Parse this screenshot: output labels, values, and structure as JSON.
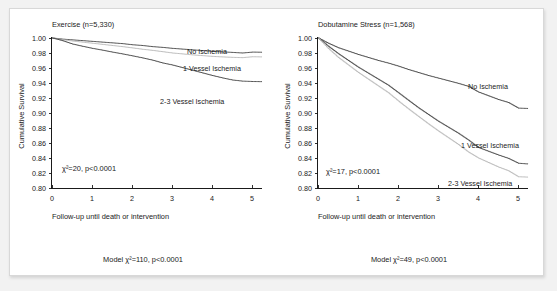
{
  "figure": {
    "background_color": "#f2f2f2",
    "panel_color": "#ffffff",
    "border_color": "#d8d8d8"
  },
  "chart_data": [
    {
      "type": "line",
      "id": "exercise",
      "title": "Exercise (n=5,330)",
      "xlabel": "Follow-up until death or intervention",
      "ylabel": "Cumulative Survival",
      "xlim": [
        0,
        5.25
      ],
      "ylim": [
        0.8,
        1.0
      ],
      "xticks": [
        "0",
        "1",
        "2",
        "3",
        "4",
        "5"
      ],
      "xtick_values": [
        0,
        1,
        2,
        3,
        4,
        5
      ],
      "yticks": [
        "1.00",
        "0.98",
        "0.96",
        "0.94",
        "0.92",
        "0.90",
        "0.88",
        "0.86",
        "0.84",
        "0.82",
        "0.80"
      ],
      "ytick_values": [
        1.0,
        0.98,
        0.96,
        0.94,
        0.92,
        0.9,
        0.88,
        0.86,
        0.84,
        0.82,
        0.8
      ],
      "grid": false,
      "legend_position": "inline-right-of-curves",
      "annotation": "χ²=20, p<0.0001",
      "footer": "Model χ²=110, p<0.0001",
      "series": [
        {
          "name": "No Ischemia",
          "color": "#3a3a3a",
          "label_position": "upper-right",
          "x": [
            0,
            0.25,
            0.5,
            0.75,
            1.0,
            1.25,
            1.5,
            1.75,
            2.0,
            2.25,
            2.5,
            2.75,
            3.0,
            3.25,
            3.5,
            3.75,
            4.0,
            4.25,
            4.5,
            4.75,
            5.0,
            5.25
          ],
          "values": [
            1.0,
            0.9985,
            0.9975,
            0.9965,
            0.9955,
            0.9945,
            0.9935,
            0.9925,
            0.991,
            0.99,
            0.9885,
            0.9875,
            0.9862,
            0.9852,
            0.9842,
            0.9832,
            0.9822,
            0.9815,
            0.9808,
            0.98,
            0.9812,
            0.981
          ]
        },
        {
          "name": "1 Vessel Ischemia",
          "color": "#b4b4b4",
          "label_position": "middle-right",
          "x": [
            0,
            0.25,
            0.5,
            0.75,
            1.0,
            1.25,
            1.5,
            1.75,
            2.0,
            2.25,
            2.5,
            2.75,
            3.0,
            3.25,
            3.5,
            3.75,
            4.0,
            4.25,
            4.5,
            4.75,
            5.0,
            5.25
          ],
          "values": [
            1.0,
            0.9978,
            0.996,
            0.9945,
            0.993,
            0.9915,
            0.99,
            0.9885,
            0.9868,
            0.985,
            0.9835,
            0.9818,
            0.98,
            0.9788,
            0.9775,
            0.9765,
            0.9755,
            0.9748,
            0.9742,
            0.9738,
            0.975,
            0.9748
          ]
        },
        {
          "name": "2-3 Vessel Ischemia",
          "color": "#3a3a3a",
          "label_position": "lower-right",
          "x": [
            0,
            0.25,
            0.5,
            0.75,
            1.0,
            1.25,
            1.5,
            1.75,
            2.0,
            2.25,
            2.5,
            2.75,
            3.0,
            3.25,
            3.5,
            3.75,
            4.0,
            4.25,
            4.5,
            4.75,
            5.0,
            5.25
          ],
          "values": [
            1.0,
            0.9965,
            0.992,
            0.989,
            0.9862,
            0.9838,
            0.9812,
            0.9788,
            0.9762,
            0.9735,
            0.9705,
            0.9668,
            0.964,
            0.9605,
            0.957,
            0.9535,
            0.95,
            0.9468,
            0.944,
            0.9425,
            0.942,
            0.9418
          ]
        }
      ]
    },
    {
      "type": "line",
      "id": "dobutamine",
      "title": "Dobutamine Stress (n=1,568)",
      "xlabel": "Follow-up until death or intervention",
      "ylabel": "Cumulative Survival",
      "xlim": [
        0,
        5.25
      ],
      "ylim": [
        0.8,
        1.0
      ],
      "xticks": [
        "0",
        "1",
        "2",
        "3",
        "4",
        "5"
      ],
      "xtick_values": [
        0,
        1,
        2,
        3,
        4,
        5
      ],
      "yticks": [
        "1.00",
        "0.98",
        "0.96",
        "0.94",
        "0.92",
        "0.90",
        "0.88",
        "0.86",
        "0.84",
        "0.82",
        "0.80"
      ],
      "ytick_values": [
        1.0,
        0.98,
        0.96,
        0.94,
        0.92,
        0.9,
        0.88,
        0.86,
        0.84,
        0.82,
        0.8
      ],
      "grid": false,
      "legend_position": "inline-right-of-curves",
      "annotation": "χ²=17, p<0.0001",
      "footer": "Model χ²=49, p<0.0001",
      "series": [
        {
          "name": "No Ischemia",
          "color": "#3a3a3a",
          "label_position": "upper-right",
          "x": [
            0,
            0.25,
            0.5,
            0.75,
            1.0,
            1.25,
            1.5,
            1.75,
            2.0,
            2.25,
            2.5,
            2.75,
            3.0,
            3.25,
            3.5,
            3.75,
            4.0,
            4.25,
            4.5,
            4.75,
            5.0,
            5.25
          ],
          "values": [
            1.0,
            0.993,
            0.987,
            0.9825,
            0.978,
            0.974,
            0.97,
            0.9665,
            0.9625,
            0.958,
            0.954,
            0.95,
            0.9465,
            0.943,
            0.9395,
            0.9355,
            0.928,
            0.923,
            0.918,
            0.914,
            0.9065,
            0.906
          ]
        },
        {
          "name": "1 Vessel Ischemia",
          "color": "#3a3a3a",
          "label_position": "middle-right",
          "x": [
            0,
            0.25,
            0.5,
            0.75,
            1.0,
            1.25,
            1.5,
            1.75,
            2.0,
            2.25,
            2.5,
            2.75,
            3.0,
            3.25,
            3.5,
            3.75,
            4.0,
            4.25,
            4.5,
            4.75,
            5.0,
            5.25
          ],
          "values": [
            1.0,
            0.989,
            0.979,
            0.97,
            0.961,
            0.953,
            0.945,
            0.937,
            0.927,
            0.917,
            0.907,
            0.898,
            0.889,
            0.881,
            0.873,
            0.864,
            0.854,
            0.849,
            0.844,
            0.8395,
            0.833,
            0.832
          ]
        },
        {
          "name": "2-3 Vessel Ischemia",
          "color": "#b4b4b4",
          "label_position": "lower-right",
          "x": [
            0,
            0.25,
            0.5,
            0.75,
            1.0,
            1.25,
            1.5,
            1.75,
            2.0,
            2.25,
            2.5,
            2.75,
            3.0,
            3.25,
            3.5,
            3.75,
            4.0,
            4.25,
            4.5,
            4.75,
            5.0,
            5.25
          ],
          "values": [
            1.0,
            0.986,
            0.974,
            0.964,
            0.954,
            0.945,
            0.936,
            0.927,
            0.916,
            0.9055,
            0.8955,
            0.8855,
            0.876,
            0.867,
            0.858,
            0.848,
            0.84,
            0.834,
            0.828,
            0.823,
            0.815,
            0.8145
          ]
        }
      ]
    }
  ]
}
